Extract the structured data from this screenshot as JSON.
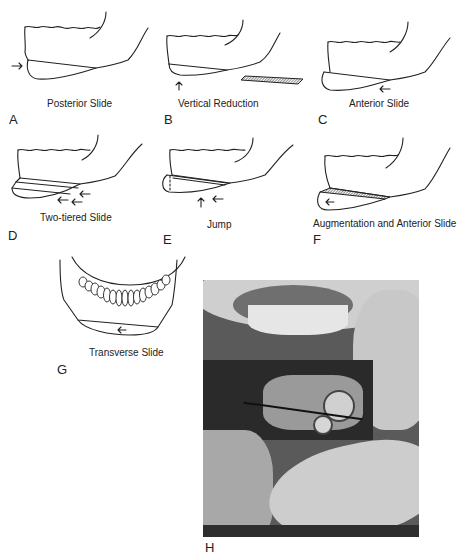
{
  "figure": {
    "panels": [
      {
        "letter": "A",
        "caption": "Posterior Slide"
      },
      {
        "letter": "B",
        "caption": "Vertical Reduction"
      },
      {
        "letter": "C",
        "caption": "Anterior Slide"
      },
      {
        "letter": "D",
        "caption": "Two-tiered Slide"
      },
      {
        "letter": "E",
        "caption": "Jump"
      },
      {
        "letter": "F",
        "caption": "Augmentation and Anterior Slide"
      },
      {
        "letter": "G",
        "caption": "Transverse Slide"
      },
      {
        "letter": "H",
        "caption": ""
      }
    ]
  }
}
